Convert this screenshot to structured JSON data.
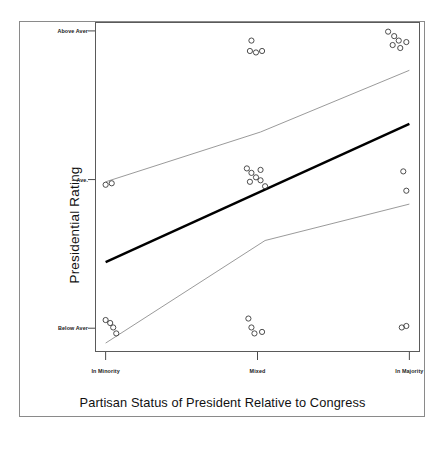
{
  "figure": {
    "background_color": "#ffffff",
    "frame_color": "#8a8a8a",
    "panel_border_color": "#5a5a5a"
  },
  "axis_titles": {
    "y": "Presidential Rating",
    "x": "Partisan Status of President Relative to Congress"
  },
  "chart_data": {
    "type": "scatter",
    "title": "",
    "subtitle": "",
    "xlabel": "Partisan Status of President Relative to Congress",
    "ylabel": "Presidential Rating",
    "grid": false,
    "legend_position": "none",
    "categories": [
      "In Minority",
      "Mixed",
      "In Majority"
    ],
    "x_tick_labels": [
      "In Minority",
      "Mixed",
      "In Majority"
    ],
    "x_tick_values": [
      1,
      2,
      3
    ],
    "xlim": [
      0.93,
      3.07
    ],
    "y_tick_labels": [
      "Above Aver",
      "Ave.",
      "Below Aver"
    ],
    "y_tick_values": [
      3,
      2,
      1
    ],
    "ylim": [
      0.84,
      3.06
    ],
    "marker": {
      "shape": "open-circle",
      "edge_color": "#3a3a3a",
      "fill": "none",
      "radius_px": 2.6
    },
    "series": [
      {
        "name": "Observations",
        "type": "scatter",
        "points": [
          {
            "x": 1.0,
            "y": 1.965
          },
          {
            "x": 1.04,
            "y": 1.975
          },
          {
            "x": 1.0,
            "y": 1.055
          },
          {
            "x": 1.03,
            "y": 1.035
          },
          {
            "x": 1.05,
            "y": 1.005
          },
          {
            "x": 1.07,
            "y": 0.965
          },
          {
            "x": 1.96,
            "y": 2.935
          },
          {
            "x": 1.95,
            "y": 2.865
          },
          {
            "x": 1.99,
            "y": 2.855
          },
          {
            "x": 2.03,
            "y": 2.865
          },
          {
            "x": 1.93,
            "y": 2.075
          },
          {
            "x": 1.96,
            "y": 2.045
          },
          {
            "x": 1.95,
            "y": 1.985
          },
          {
            "x": 1.99,
            "y": 2.015
          },
          {
            "x": 2.02,
            "y": 2.065
          },
          {
            "x": 2.02,
            "y": 1.995
          },
          {
            "x": 2.05,
            "y": 1.955
          },
          {
            "x": 1.94,
            "y": 1.065
          },
          {
            "x": 1.96,
            "y": 1.005
          },
          {
            "x": 1.98,
            "y": 0.965
          },
          {
            "x": 2.03,
            "y": 0.975
          },
          {
            "x": 2.86,
            "y": 2.995
          },
          {
            "x": 2.9,
            "y": 2.965
          },
          {
            "x": 2.93,
            "y": 2.935
          },
          {
            "x": 2.89,
            "y": 2.905
          },
          {
            "x": 2.94,
            "y": 2.885
          },
          {
            "x": 2.98,
            "y": 2.925
          },
          {
            "x": 2.96,
            "y": 2.055
          },
          {
            "x": 2.98,
            "y": 1.925
          },
          {
            "x": 2.95,
            "y": 1.005
          },
          {
            "x": 2.98,
            "y": 1.015
          }
        ]
      },
      {
        "name": "Regression line (fit)",
        "type": "line",
        "style": "solid",
        "color": "#000000",
        "width_px": 2.4,
        "points": [
          {
            "x": 1.0,
            "y": 1.445
          },
          {
            "x": 3.0,
            "y": 2.375
          }
        ]
      },
      {
        "name": "Upper confidence band",
        "type": "line",
        "style": "solid",
        "color": "#8f8f8f",
        "width_px": 0.9,
        "points": [
          {
            "x": 1.0,
            "y": 1.985
          },
          {
            "x": 2.02,
            "y": 2.32
          },
          {
            "x": 3.0,
            "y": 2.735
          }
        ]
      },
      {
        "name": "Lower confidence band",
        "type": "line",
        "style": "solid",
        "color": "#8f8f8f",
        "width_px": 0.9,
        "points": [
          {
            "x": 1.0,
            "y": 0.9
          },
          {
            "x": 2.05,
            "y": 1.59
          },
          {
            "x": 3.0,
            "y": 1.835
          }
        ]
      }
    ]
  }
}
